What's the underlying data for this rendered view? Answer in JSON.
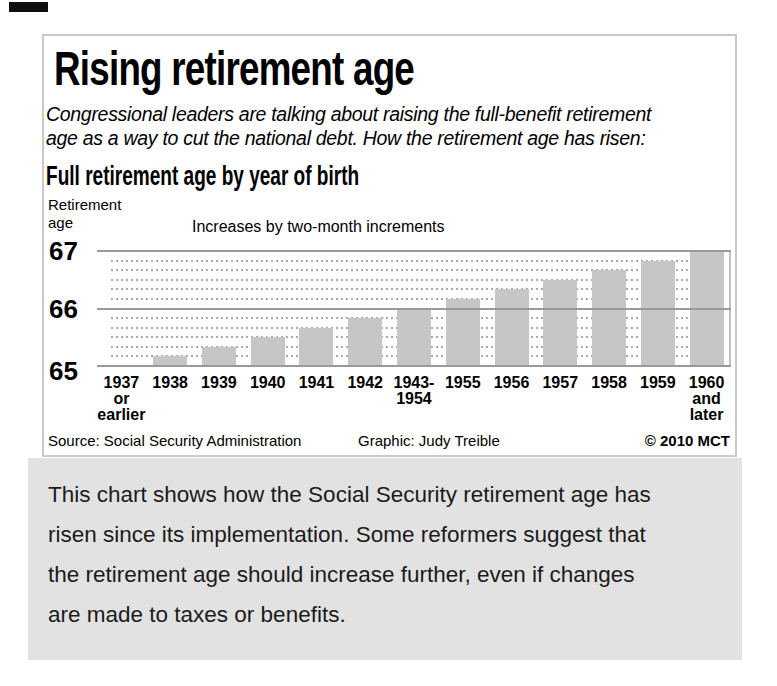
{
  "artifact": {
    "note": "small black scan mark in top-left corner"
  },
  "infographic": {
    "title": "Rising retirement age",
    "subtitle_lines": [
      "Congressional leaders are talking about raising the full-benefit retirement",
      "age as a way to cut the national debt. How the retirement age has risen:"
    ],
    "chart_heading": "Full retirement age by year of birth",
    "y_axis_title_lines": [
      "Retirement",
      "age"
    ],
    "annotation": "Increases by two-month increments",
    "source": "Source: Social Security Administration",
    "credit": "Graphic: Judy Treible",
    "copyright": "© 2010 MCT"
  },
  "chart_data": {
    "type": "bar",
    "title": "Full retirement age by year of birth",
    "annotation": "Increases by two-month increments",
    "ylabel": "Retirement age",
    "xlabel": "Year of birth",
    "categories": [
      "1937 or earlier",
      "1938",
      "1939",
      "1940",
      "1941",
      "1942",
      "1943-1954",
      "1955",
      "1956",
      "1957",
      "1958",
      "1959",
      "1960 and later"
    ],
    "x_tick_lines": [
      [
        "1937",
        "or",
        "earlier"
      ],
      [
        "1938"
      ],
      [
        "1939"
      ],
      [
        "1940"
      ],
      [
        "1941"
      ],
      [
        "1942"
      ],
      [
        "1943-",
        "1954"
      ],
      [
        "1955"
      ],
      [
        "1956"
      ],
      [
        "1957"
      ],
      [
        "1958"
      ],
      [
        "1959"
      ],
      [
        "1960",
        "and",
        "later"
      ]
    ],
    "values": [
      65,
      65.167,
      65.333,
      65.5,
      65.667,
      65.833,
      66,
      66.167,
      66.333,
      66.5,
      66.667,
      66.833,
      67
    ],
    "unit": "years of age",
    "ylim": [
      65,
      67
    ],
    "yticks": [
      65,
      66,
      67
    ],
    "increments_per_year": 6,
    "grid": "solid lines at whole years, dotted lines at two-month increments",
    "bar_color": "#c6c6c6",
    "grid_solid_color": "#9a9a9a",
    "grid_dotted_color": "#ababab"
  },
  "caption": {
    "background": "#e2e2e2",
    "lines": [
      "This chart shows how the Social Security retirement age has",
      "risen since its implementation. Some reformers suggest that",
      "the retirement age should increase further, even if changes",
      "are made to taxes or benefits."
    ]
  }
}
